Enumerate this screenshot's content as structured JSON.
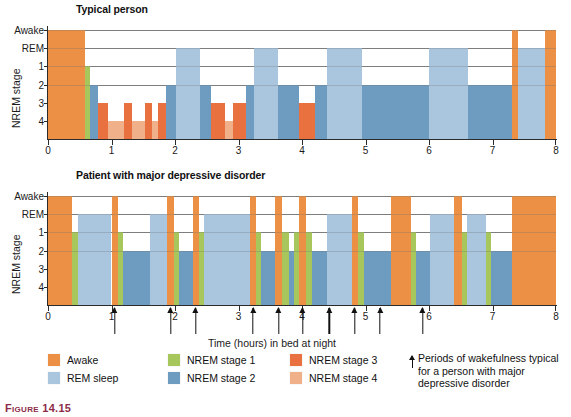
{
  "figure": {
    "caption_label": "Figure 14.15"
  },
  "colors": {
    "awake": "#eb9045",
    "rem": "#a9c6de",
    "stage1": "#a7c65c",
    "stage2": "#6e9bc0",
    "stage3": "#e8713f",
    "stage4": "#f0b08a",
    "axis": "#2b2b2b",
    "grid": "#6f6f6f"
  },
  "panels": {
    "top": {
      "title": "Typical person",
      "y_title": "NREM stage",
      "y_labels": [
        "Awake",
        "REM",
        "1",
        "2",
        "3",
        "4"
      ],
      "x_labels": [
        "0",
        "1",
        "2",
        "3",
        "4",
        "5",
        "6",
        "7",
        "8"
      ]
    },
    "bottom": {
      "title": "Patient with major depressive disorder",
      "y_title": "NREM stage",
      "y_labels": [
        "Awake",
        "REM",
        "1",
        "2",
        "3",
        "4"
      ],
      "x_labels": [
        "0",
        "1",
        "2",
        "3",
        "4",
        "5",
        "6",
        "7",
        "8"
      ]
    }
  },
  "axis": {
    "x_title": "Time (hours) in bed at night"
  },
  "legend": {
    "col1": [
      {
        "label": "Awake",
        "color": "#eb9045",
        "key": "awake"
      },
      {
        "label": "REM sleep",
        "color": "#a9c6de",
        "key": "rem"
      }
    ],
    "col2": [
      {
        "label": "NREM stage 1",
        "color": "#a7c65c",
        "key": "stage1"
      },
      {
        "label": "NREM stage 2",
        "color": "#6e9bc0",
        "key": "stage2"
      }
    ],
    "col3": [
      {
        "label": "NREM stage 3",
        "color": "#e8713f",
        "key": "stage3"
      },
      {
        "label": "NREM stage 4",
        "color": "#f0b08a",
        "key": "stage4"
      }
    ],
    "note": "Periods of wakefulness typical for a person with major depressive disorder"
  },
  "chart_data": {
    "type": "area",
    "xlabel": "Time (hours) in bed at night",
    "ylabel": "NREM stage",
    "xlim": [
      0,
      8
    ],
    "xticks": [
      0,
      1,
      2,
      3,
      4,
      5,
      6,
      7,
      8
    ],
    "stage_levels": [
      "Awake",
      "REM",
      "1",
      "2",
      "3",
      "4"
    ],
    "grid": true,
    "legend_position": "below",
    "panels": [
      {
        "name": "Typical person",
        "segments": [
          {
            "start": 0.0,
            "end": 0.58,
            "stage": "Awake"
          },
          {
            "start": 0.58,
            "end": 0.66,
            "stage": "1"
          },
          {
            "start": 0.66,
            "end": 0.78,
            "stage": "2"
          },
          {
            "start": 0.78,
            "end": 0.95,
            "stage": "3"
          },
          {
            "start": 0.95,
            "end": 1.2,
            "stage": "4"
          },
          {
            "start": 1.2,
            "end": 1.33,
            "stage": "3"
          },
          {
            "start": 1.33,
            "end": 1.52,
            "stage": "4"
          },
          {
            "start": 1.52,
            "end": 1.63,
            "stage": "3"
          },
          {
            "start": 1.63,
            "end": 1.74,
            "stage": "4"
          },
          {
            "start": 1.74,
            "end": 1.86,
            "stage": "3"
          },
          {
            "start": 1.86,
            "end": 2.02,
            "stage": "2"
          },
          {
            "start": 2.02,
            "end": 2.4,
            "stage": "REM"
          },
          {
            "start": 2.4,
            "end": 2.56,
            "stage": "2"
          },
          {
            "start": 2.56,
            "end": 2.78,
            "stage": "3"
          },
          {
            "start": 2.78,
            "end": 2.92,
            "stage": "4"
          },
          {
            "start": 2.92,
            "end": 3.12,
            "stage": "3"
          },
          {
            "start": 3.12,
            "end": 3.24,
            "stage": "2"
          },
          {
            "start": 3.24,
            "end": 3.62,
            "stage": "REM"
          },
          {
            "start": 3.62,
            "end": 3.96,
            "stage": "2"
          },
          {
            "start": 3.96,
            "end": 4.2,
            "stage": "3"
          },
          {
            "start": 4.2,
            "end": 4.4,
            "stage": "2"
          },
          {
            "start": 4.4,
            "end": 4.95,
            "stage": "REM"
          },
          {
            "start": 4.95,
            "end": 5.2,
            "stage": "2"
          },
          {
            "start": 5.2,
            "end": 6.0,
            "stage": "2"
          },
          {
            "start": 6.0,
            "end": 6.62,
            "stage": "REM"
          },
          {
            "start": 6.62,
            "end": 7.3,
            "stage": "2"
          },
          {
            "start": 7.3,
            "end": 7.4,
            "stage": "Awake"
          },
          {
            "start": 7.4,
            "end": 7.82,
            "stage": "REM"
          },
          {
            "start": 7.82,
            "end": 8.0,
            "stage": "Awake"
          }
        ]
      },
      {
        "name": "Patient with major depressive disorder",
        "segments": [
          {
            "start": 0.0,
            "end": 0.38,
            "stage": "Awake"
          },
          {
            "start": 0.38,
            "end": 0.48,
            "stage": "1"
          },
          {
            "start": 0.48,
            "end": 1.0,
            "stage": "REM"
          },
          {
            "start": 1.0,
            "end": 1.1,
            "stage": "Awake"
          },
          {
            "start": 1.1,
            "end": 1.18,
            "stage": "1"
          },
          {
            "start": 1.18,
            "end": 1.6,
            "stage": "2"
          },
          {
            "start": 1.6,
            "end": 1.88,
            "stage": "REM"
          },
          {
            "start": 1.88,
            "end": 1.98,
            "stage": "Awake"
          },
          {
            "start": 1.98,
            "end": 2.06,
            "stage": "1"
          },
          {
            "start": 2.06,
            "end": 2.28,
            "stage": "2"
          },
          {
            "start": 2.28,
            "end": 2.38,
            "stage": "Awake"
          },
          {
            "start": 2.38,
            "end": 2.45,
            "stage": "1"
          },
          {
            "start": 2.45,
            "end": 3.18,
            "stage": "REM"
          },
          {
            "start": 3.18,
            "end": 3.28,
            "stage": "Awake"
          },
          {
            "start": 3.28,
            "end": 3.36,
            "stage": "1"
          },
          {
            "start": 3.36,
            "end": 3.58,
            "stage": "2"
          },
          {
            "start": 3.58,
            "end": 3.68,
            "stage": "Awake"
          },
          {
            "start": 3.68,
            "end": 3.8,
            "stage": "1"
          },
          {
            "start": 3.8,
            "end": 3.88,
            "stage": "2"
          },
          {
            "start": 3.88,
            "end": 3.96,
            "stage": "1"
          },
          {
            "start": 3.96,
            "end": 4.06,
            "stage": "Awake"
          },
          {
            "start": 4.06,
            "end": 4.16,
            "stage": "1"
          },
          {
            "start": 4.16,
            "end": 4.4,
            "stage": "2"
          },
          {
            "start": 4.4,
            "end": 4.78,
            "stage": "REM"
          },
          {
            "start": 4.78,
            "end": 4.88,
            "stage": "Awake"
          },
          {
            "start": 4.88,
            "end": 4.98,
            "stage": "1"
          },
          {
            "start": 4.98,
            "end": 5.4,
            "stage": "2"
          },
          {
            "start": 5.4,
            "end": 5.72,
            "stage": "Awake"
          },
          {
            "start": 5.72,
            "end": 5.8,
            "stage": "1"
          },
          {
            "start": 5.8,
            "end": 6.02,
            "stage": "2"
          },
          {
            "start": 6.02,
            "end": 6.4,
            "stage": "REM"
          },
          {
            "start": 6.4,
            "end": 6.52,
            "stage": "Awake"
          },
          {
            "start": 6.52,
            "end": 6.6,
            "stage": "1"
          },
          {
            "start": 6.6,
            "end": 6.9,
            "stage": "REM"
          },
          {
            "start": 6.9,
            "end": 6.98,
            "stage": "1"
          },
          {
            "start": 6.98,
            "end": 7.3,
            "stage": "2"
          },
          {
            "start": 7.3,
            "end": 8.0,
            "stage": "Awake"
          }
        ],
        "wakefulness_arrows": [
          1.05,
          1.93,
          2.33,
          3.23,
          3.63,
          4.01,
          4.43,
          4.83,
          5.23,
          5.9
        ]
      }
    ]
  }
}
